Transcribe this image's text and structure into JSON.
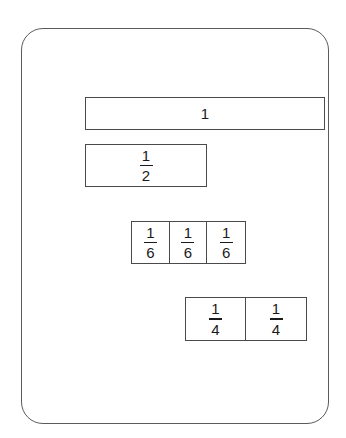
{
  "diagram": {
    "frame": {
      "shape": "rounded-rectangle",
      "stroke_color": "#5b5b5b",
      "fill_color": "#ffffff"
    },
    "stroke_color": "#4a4a4a",
    "text_color": "#1a1a1a",
    "rows": [
      {
        "id": "whole",
        "label": "one whole",
        "cell_count": 1,
        "cells": [
          {
            "kind": "whole",
            "text": "1"
          }
        ]
      },
      {
        "id": "halves",
        "label": "one half",
        "cell_count": 1,
        "cells": [
          {
            "kind": "fraction",
            "numerator": "1",
            "denominator": "2"
          }
        ]
      },
      {
        "id": "sixths",
        "label": "three sixths",
        "cell_count": 3,
        "cells": [
          {
            "kind": "fraction",
            "numerator": "1",
            "denominator": "6"
          },
          {
            "kind": "fraction",
            "numerator": "1",
            "denominator": "6"
          },
          {
            "kind": "fraction",
            "numerator": "1",
            "denominator": "6"
          }
        ]
      },
      {
        "id": "fourths",
        "label": "two fourths",
        "cell_count": 2,
        "cells": [
          {
            "kind": "fraction",
            "numerator": "1",
            "denominator": "4"
          },
          {
            "kind": "fraction",
            "numerator": "1",
            "denominator": "4"
          }
        ]
      }
    ]
  }
}
